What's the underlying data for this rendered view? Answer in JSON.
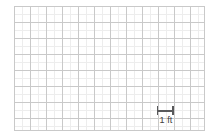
{
  "figure": {
    "type": "grid-scale-diagram",
    "background_color": "#ffffff",
    "alt_title": "Blank scaled graph-paper grid with 1 ft scale bar"
  },
  "grid": {
    "major_columns": 12,
    "major_rows": 8,
    "minor_per_major": 2,
    "major_cell_px": 16,
    "minor_cell_px": 8,
    "major_line_color": "#c9c9c9",
    "minor_line_color": "#ededed",
    "border_color": "#c9c9c9",
    "origin_x_px": 14,
    "origin_y_px": 6,
    "width_px": 191,
    "height_px": 125
  },
  "scale_bar": {
    "label": "1 ft",
    "unit": "ft",
    "value": 1,
    "length_px": 16,
    "color": "#58595b",
    "icon": "i-beam-scale-icon"
  },
  "chart_data": {
    "type": "table",
    "title": "",
    "xlabel": "",
    "ylabel": "",
    "categories": [],
    "values": [],
    "annotations": [
      "1 ft"
    ],
    "grid": true,
    "legend": "none"
  }
}
